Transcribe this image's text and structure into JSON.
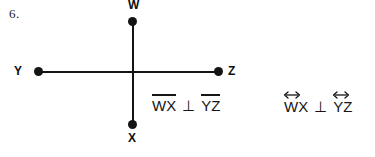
{
  "problem": {
    "number": "6."
  },
  "figure": {
    "points": [
      {
        "id": "w",
        "label": "W"
      },
      {
        "id": "x",
        "label": "X"
      },
      {
        "id": "y",
        "label": "Y"
      },
      {
        "id": "z",
        "label": "Z"
      }
    ],
    "segments": [
      {
        "id": "wx",
        "from": "W",
        "to": "X",
        "orientation": "vertical"
      },
      {
        "id": "yz",
        "from": "Y",
        "to": "Z",
        "orientation": "horizontal"
      }
    ]
  },
  "notations": {
    "segment_form": {
      "first": "WX",
      "symbol": "⊥",
      "second": "YZ",
      "decoration": "overbar"
    },
    "line_form": {
      "first": "WX",
      "symbol": "⊥",
      "second": "YZ",
      "decoration": "double-arrow"
    }
  },
  "colors": {
    "ink": "#141414",
    "background": "#ffffff"
  }
}
